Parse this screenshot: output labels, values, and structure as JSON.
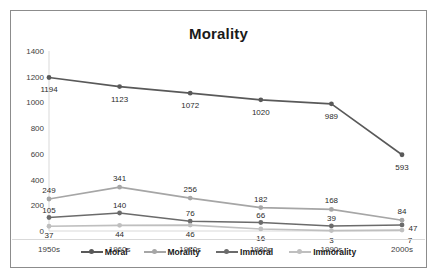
{
  "chart_data": {
    "type": "line",
    "title": "Morality",
    "xlabel": "",
    "ylabel": "",
    "categories": [
      "1950s",
      "1960s",
      "1970s",
      "1980s",
      "1990s",
      "2000s"
    ],
    "ylim": [
      0,
      1400
    ],
    "yticks": [
      0,
      200,
      400,
      600,
      800,
      1000,
      1200,
      1400
    ],
    "ytick_labels": [
      "0",
      "200",
      "400",
      "600",
      "800",
      "1000",
      "1200",
      "1400"
    ],
    "grid": false,
    "legend_position": "bottom",
    "data_labels": true,
    "series": [
      {
        "name": "Moral",
        "color": "#595959",
        "values": [
          1194,
          1123,
          1072,
          1020,
          989,
          593
        ],
        "labels": [
          "1194",
          "1123",
          "1072",
          "1020",
          "989",
          "593"
        ]
      },
      {
        "name": "Morality",
        "color": "#a6a6a6",
        "values": [
          249,
          341,
          256,
          182,
          168,
          84
        ],
        "labels": [
          "249",
          "341",
          "256",
          "182",
          "168",
          "84"
        ]
      },
      {
        "name": "Immoral",
        "color": "#6b6b6b",
        "values": [
          105,
          140,
          76,
          66,
          39,
          47
        ],
        "labels": [
          "105",
          "140",
          "76",
          "66",
          "39",
          "47"
        ]
      },
      {
        "name": "Immorality",
        "color": "#bfbfbf",
        "values": [
          37,
          44,
          46,
          16,
          3,
          7
        ],
        "labels": [
          "37",
          "44",
          "46",
          "16",
          "3",
          "7"
        ]
      }
    ]
  }
}
